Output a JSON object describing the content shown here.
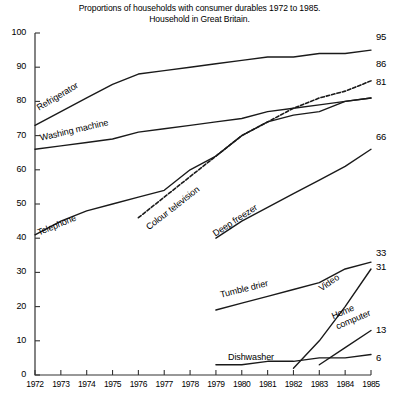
{
  "chart_data": {
    "type": "line",
    "title": "Proportions of households with consumer durables 1972 to 1985.",
    "subtitle": "Household in Great Britain.",
    "xlabel": "",
    "ylabel": "",
    "xlim": [
      1972,
      1985
    ],
    "ylim": [
      0,
      100
    ],
    "grid": false,
    "legend_position": "inline-labels",
    "yticks": [
      0,
      10,
      20,
      30,
      40,
      50,
      60,
      70,
      80,
      90,
      100
    ],
    "categories": [
      1972,
      1973,
      1974,
      1975,
      1976,
      1977,
      1978,
      1979,
      1980,
      1981,
      1982,
      1983,
      1984,
      1985
    ],
    "series": [
      {
        "name": "Refrigerator",
        "label": "Refrigerator",
        "end_value": 95,
        "style": "solid",
        "x": [
          1972,
          1973,
          1974,
          1975,
          1976,
          1977,
          1978,
          1979,
          1980,
          1981,
          1982,
          1983,
          1984,
          1985
        ],
        "values": [
          73,
          77,
          81,
          85,
          88,
          89,
          90,
          91,
          92,
          93,
          93,
          94,
          94,
          95
        ]
      },
      {
        "name": "Washing machine",
        "label": "Washing machine",
        "end_value": 81,
        "style": "solid",
        "x": [
          1972,
          1973,
          1974,
          1975,
          1976,
          1977,
          1978,
          1979,
          1980,
          1981,
          1982,
          1983,
          1984,
          1985
        ],
        "values": [
          66,
          67,
          68,
          69,
          71,
          72,
          73,
          74,
          75,
          77,
          78,
          79,
          80,
          81
        ]
      },
      {
        "name": "Telephone",
        "label": "Telephone",
        "end_value": 81,
        "style": "solid",
        "x": [
          1972,
          1973,
          1974,
          1975,
          1976,
          1977,
          1978,
          1979,
          1980,
          1981,
          1982,
          1983,
          1984,
          1985
        ],
        "values": [
          41,
          45,
          48,
          50,
          52,
          54,
          60,
          64,
          70,
          74,
          76,
          77,
          80,
          81
        ]
      },
      {
        "name": "Colour television",
        "label": "Colour television",
        "end_value": 86,
        "style": "dashed",
        "x": [
          1976,
          1977,
          1978,
          1979,
          1980,
          1981,
          1982,
          1983,
          1984,
          1985
        ],
        "values": [
          46,
          52,
          58,
          64,
          70,
          74,
          78,
          81,
          83,
          86
        ]
      },
      {
        "name": "Deep freezer",
        "label": "Deep freezer",
        "end_value": 66,
        "style": "solid",
        "x": [
          1979,
          1980,
          1981,
          1982,
          1983,
          1984,
          1985
        ],
        "values": [
          40,
          45,
          49,
          53,
          57,
          61,
          66
        ]
      },
      {
        "name": "Tumble drier",
        "label": "Tumble drier",
        "end_value": 33,
        "style": "solid",
        "x": [
          1979,
          1980,
          1981,
          1982,
          1983,
          1984,
          1985
        ],
        "values": [
          19,
          21,
          23,
          25,
          27,
          31,
          33
        ]
      },
      {
        "name": "Video",
        "label": "Video",
        "end_value": 31,
        "style": "solid",
        "x": [
          1982,
          1983,
          1984,
          1985
        ],
        "values": [
          2,
          10,
          20,
          31
        ]
      },
      {
        "name": "Home computer",
        "label": "Home computer",
        "end_value": 13,
        "style": "solid",
        "x": [
          1983,
          1984,
          1985
        ],
        "values": [
          3,
          8,
          13
        ]
      },
      {
        "name": "Dishwasher",
        "label": "Dishwasher",
        "end_value": 6,
        "style": "solid",
        "x": [
          1979,
          1980,
          1981,
          1982,
          1983,
          1984,
          1985
        ],
        "values": [
          3,
          3,
          4,
          4,
          5,
          5,
          6
        ]
      }
    ],
    "series_label_positions": [
      {
        "name": "Refrigerator",
        "x": 35,
        "y": 104,
        "rot": -31
      },
      {
        "name": "Washing machine",
        "x": 39,
        "y": 133,
        "rot": -13
      },
      {
        "name": "Telephone",
        "x": 36,
        "y": 228,
        "rot": -22
      },
      {
        "name": "Colour television",
        "x": 144,
        "y": 224,
        "rot": -38
      },
      {
        "name": "Deep freezer",
        "x": 211,
        "y": 230,
        "rot": -33
      },
      {
        "name": "Tumble drier",
        "x": 219,
        "y": 290,
        "rot": -14
      },
      {
        "name": "Video",
        "x": 317,
        "y": 285,
        "rot": -35
      },
      {
        "name": "Home computer",
        "x": 330,
        "y": 312,
        "rot": -23
      },
      {
        "name": "Dishwasher",
        "x": 228,
        "y": 352,
        "rot": 0
      }
    ]
  },
  "axis": {
    "ytick_labels": [
      "100",
      "90",
      "80",
      "70",
      "60",
      "50",
      "40",
      "30",
      "20",
      "10",
      "0"
    ],
    "xtick_labels": [
      "1972",
      "1973",
      "1974",
      "1975",
      "1976",
      "1977",
      "1978",
      "1979",
      "1980",
      "1981",
      "1982",
      "1983",
      "1984",
      "1985"
    ]
  },
  "end_labels": [
    {
      "text": "95",
      "y": 37
    },
    {
      "text": "86",
      "y": 64
    },
    {
      "text": "81",
      "y": 82
    },
    {
      "text": "66",
      "y": 137
    },
    {
      "text": "33",
      "y": 253
    },
    {
      "text": "31",
      "y": 267
    },
    {
      "text": "13",
      "y": 330
    },
    {
      "text": "6",
      "y": 358
    }
  ],
  "colors": {
    "line": "#1a1a1a",
    "axis": "#333333",
    "background": "#ffffff"
  }
}
